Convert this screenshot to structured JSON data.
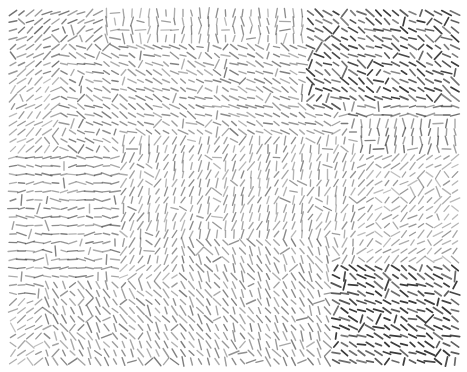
{
  "image": {
    "description": "Orientation field texture rendered as short oriented line segments on a regular grid",
    "width": 467,
    "height": 372,
    "background": "#ffffff",
    "stroke_color": "#3a3a3a",
    "grid": {
      "x0": 13,
      "y0": 13,
      "x1": 455,
      "y1": 362,
      "step": 8.5
    },
    "regions": [
      {
        "name": "top-left-diagonal",
        "x": [
          0,
          115
        ],
        "y": [
          0,
          80
        ],
        "angle": 30,
        "density": 0.6
      },
      {
        "name": "top-middle-vertical",
        "x": [
          100,
          320
        ],
        "y": [
          0,
          40
        ],
        "angle": 90,
        "density": 0.5
      },
      {
        "name": "upper-band-wavy",
        "x": [
          60,
          330
        ],
        "y": [
          40,
          150
        ],
        "angle": -25,
        "density": 0.55
      },
      {
        "name": "top-right-dense-diagonal",
        "x": [
          310,
          467
        ],
        "y": [
          0,
          110
        ],
        "angle": -30,
        "density": 0.85
      },
      {
        "name": "right-horizontal",
        "x": [
          340,
          467
        ],
        "y": [
          100,
          130
        ],
        "angle": 0,
        "density": 0.65
      },
      {
        "name": "right-vertical",
        "x": [
          350,
          467
        ],
        "y": [
          120,
          150
        ],
        "angle": 88,
        "density": 0.6
      },
      {
        "name": "center-mixed",
        "x": [
          120,
          360
        ],
        "y": [
          140,
          260
        ],
        "angle": 70,
        "density": 0.5
      },
      {
        "name": "left-horizontal",
        "x": [
          0,
          120
        ],
        "y": [
          150,
          300
        ],
        "angle": 0,
        "density": 0.55
      },
      {
        "name": "lower-left-diagonal",
        "x": [
          40,
          200
        ],
        "y": [
          280,
          370
        ],
        "angle": -55,
        "density": 0.55
      },
      {
        "name": "lower-middle-diagonal",
        "x": [
          180,
          340
        ],
        "y": [
          240,
          370
        ],
        "angle": -60,
        "density": 0.55
      },
      {
        "name": "bottom-right-dense",
        "x": [
          330,
          467
        ],
        "y": [
          260,
          372
        ],
        "angle": -25,
        "density": 0.95
      }
    ]
  }
}
